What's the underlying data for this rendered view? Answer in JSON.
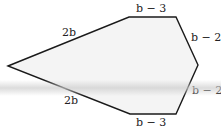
{
  "figure": {
    "shape": "hexagon",
    "fill_color": "#f4f4f4",
    "stroke_color": "#1a1a1a",
    "sides": [
      {
        "id": "upper-left",
        "label": "2b"
      },
      {
        "id": "top",
        "label": "b − 3"
      },
      {
        "id": "upper-right",
        "label": "b − 2"
      },
      {
        "id": "lower-right",
        "label": "b − 2"
      },
      {
        "id": "bottom",
        "label": "b − 3"
      },
      {
        "id": "lower-left",
        "label": "2b"
      }
    ]
  }
}
